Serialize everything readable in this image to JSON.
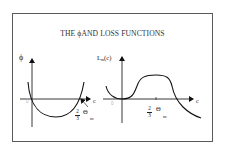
{
  "title": "THE ϕAND LOSS FUNCTIONS",
  "colors": {
    "frame": "#5a5a5a",
    "ink": "#222222",
    "faint_label": "#b0b0b0",
    "background": "#ffffff"
  },
  "left_plot": {
    "y_label": "ϕ",
    "x_label": "c",
    "origin_label": "0",
    "marker": {
      "numerator": "2",
      "denominator": "3",
      "symbol": "Θ",
      "subscript": "m"
    },
    "curve": "parabola (U-shape) crossing x-axis at origin and at 2/3Θm"
  },
  "right_plot": {
    "y_label_main": "L",
    "y_label_sub": "m",
    "y_label_arg": "(c)",
    "x_label": "c",
    "origin_label": "0",
    "marker": {
      "numerator": "2",
      "denominator": "3",
      "symbol": "Θ",
      "subscript": "m"
    },
    "curve": "loss function: touches zero at origin, plateau above, drops below axis past 2/3Θm"
  }
}
